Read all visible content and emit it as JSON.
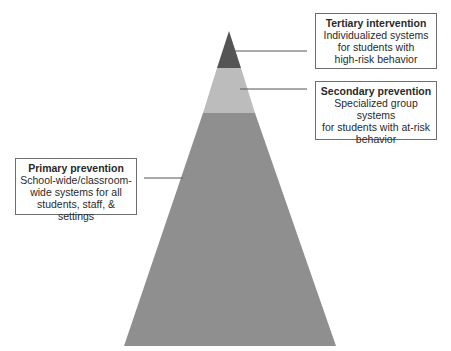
{
  "diagram": {
    "type": "tiered-pyramid",
    "colors": {
      "tertiary": "#545454",
      "secondary": "#bcbcbc",
      "primary": "#8f8f8f",
      "connector": "#555555",
      "box_border": "#6e6e6e"
    },
    "tiers": [
      {
        "id": "tertiary",
        "title": "Tertiary intervention",
        "description": "Individualized systems for students with high-risk behavior",
        "lines": [
          "Individualized systems",
          "for students with",
          "high-risk behavior"
        ]
      },
      {
        "id": "secondary",
        "title": "Secondary prevention",
        "description": "Specialized group systems for students with at-risk behavior",
        "lines": [
          "Specialized group systems",
          "for students with at-risk",
          "behavior"
        ]
      },
      {
        "id": "primary",
        "title": "Primary prevention",
        "description": "School-wide/classroom-wide systems for all students, staff, & settings",
        "lines": [
          "School-wide/classroom-",
          "wide systems for all",
          "students, staff, & settings"
        ]
      }
    ]
  }
}
